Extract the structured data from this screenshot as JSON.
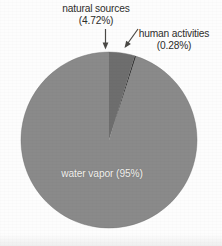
{
  "figure": {
    "name": "atmospheric-greenhouse-gas-pie-chart",
    "background_color": "#fdfdfd"
  },
  "chart_data": {
    "type": "pie",
    "title": "",
    "subtitle": "",
    "xlabel": "",
    "ylabel": "",
    "legend_position": "none",
    "grid": false,
    "start_angle_deg": 0,
    "direction": "clockwise",
    "categories": [
      "water vapor",
      "natural sources",
      "human activities"
    ],
    "values": [
      95,
      4.72,
      0.28
    ],
    "units": "%",
    "colors": [
      "#8a8a8a",
      "#6e6e6e",
      "#3a3a3a"
    ],
    "slices": [
      {
        "label": "water vapor",
        "value_label": "(95%)",
        "value": 95,
        "color": "#8a8a8a",
        "label_placement": "inside",
        "label_color": "#f3f2ef"
      },
      {
        "label": "natural sources",
        "value_label": "(4.72%)",
        "value": 4.72,
        "color": "#6e6e6e",
        "label_placement": "outside-top-left",
        "label_color": "#2e2d2b",
        "leader": "arrow-down"
      },
      {
        "label": "human activities",
        "value_label": "(0.28%)",
        "value": 0.28,
        "color": "#3a3a3a",
        "label_placement": "outside-top-right",
        "label_color": "#2e2d2b",
        "leader": "arrow-down-left"
      }
    ]
  },
  "labels": {
    "natural_sources": {
      "name": "natural sources",
      "percent": "(4.72%)"
    },
    "human_activities": {
      "name": "human activities",
      "percent": "(0.28%)"
    },
    "water_vapor": {
      "name": "water vapor",
      "percent": "(95%)"
    }
  },
  "icons": {
    "natural_sources_pointer": "arrow-down-icon",
    "human_activities_pointer": "arrow-down-left-icon"
  }
}
